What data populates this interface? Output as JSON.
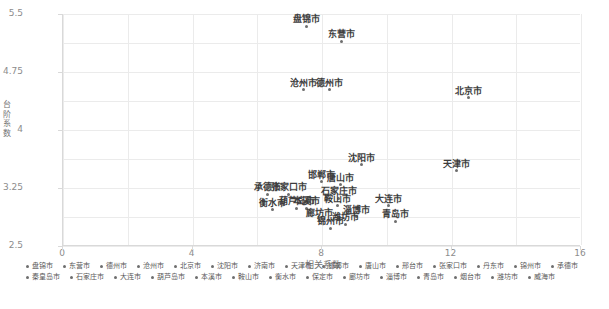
{
  "chart_data": {
    "type": "scatter",
    "title": "",
    "xlabel": "相关系数",
    "ylabel": "台阶系数",
    "xlim": [
      0,
      16
    ],
    "ylim": [
      2.5,
      5.5
    ],
    "xticks": [
      "0",
      "4",
      "8",
      "12",
      "16"
    ],
    "yticks": [
      "2.5",
      "3.25",
      "4",
      "4.75",
      "5.5"
    ],
    "grid": true,
    "legend_position": "bottom",
    "points": [
      {
        "label": "盘锦市",
        "x": 7.55,
        "y": 5.34
      },
      {
        "label": "东营市",
        "x": 8.62,
        "y": 5.15
      },
      {
        "label": "沧州市",
        "x": 7.45,
        "y": 4.52
      },
      {
        "label": "德州市",
        "x": 8.25,
        "y": 4.52
      },
      {
        "label": "北京市",
        "x": 12.55,
        "y": 4.42
      },
      {
        "label": "沈阳市",
        "x": 9.25,
        "y": 3.55
      },
      {
        "label": "天津市",
        "x": 12.2,
        "y": 3.47
      },
      {
        "label": "邯郸市",
        "x": 8.0,
        "y": 3.33
      },
      {
        "label": "唐山市",
        "x": 8.6,
        "y": 3.29
      },
      {
        "label": "承德市",
        "x": 6.35,
        "y": 3.17
      },
      {
        "label": "张家口市",
        "x": 7.0,
        "y": 3.17
      },
      {
        "label": "石家庄市",
        "x": 8.55,
        "y": 3.12
      },
      {
        "label": "鞍山市",
        "x": 8.5,
        "y": 3.02
      },
      {
        "label": "大连市",
        "x": 10.1,
        "y": 3.02
      },
      {
        "label": "衡水市",
        "x": 6.5,
        "y": 2.97
      },
      {
        "label": "葫芦岛市",
        "x": 7.25,
        "y": 2.99
      },
      {
        "label": "本溪市",
        "x": 7.55,
        "y": 2.99
      },
      {
        "label": "淄博市",
        "x": 9.1,
        "y": 2.88
      },
      {
        "label": "廊坊市",
        "x": 7.95,
        "y": 2.83
      },
      {
        "label": "青岛市",
        "x": 10.3,
        "y": 2.82
      },
      {
        "label": "潍坊市",
        "x": 8.75,
        "y": 2.78
      },
      {
        "label": "锦州市",
        "x": 8.3,
        "y": 2.73
      }
    ]
  },
  "legend": {
    "items": [
      {
        "label": "盘锦市"
      },
      {
        "label": "东营市"
      },
      {
        "label": "德州市"
      },
      {
        "label": "沧州市"
      },
      {
        "label": "北京市"
      },
      {
        "label": "沈阳市"
      },
      {
        "label": "济南市"
      },
      {
        "label": "天津市"
      },
      {
        "label": "邯郸市"
      },
      {
        "label": "唐山市"
      },
      {
        "label": "邢台市"
      },
      {
        "label": "张家口市"
      },
      {
        "label": "丹东市"
      },
      {
        "label": "锦州市"
      },
      {
        "label": "承德市"
      },
      {
        "label": "秦皇岛市"
      },
      {
        "label": "石家庄市"
      },
      {
        "label": "大连市"
      },
      {
        "label": "葫芦岛市"
      },
      {
        "label": "本溪市"
      },
      {
        "label": "鞍山市"
      },
      {
        "label": "衡水市"
      },
      {
        "label": "保定市"
      },
      {
        "label": "廊坊市"
      },
      {
        "label": "淄博市"
      },
      {
        "label": "青岛市"
      },
      {
        "label": "烟台市"
      },
      {
        "label": "潍坊市"
      },
      {
        "label": "威海市"
      }
    ]
  }
}
